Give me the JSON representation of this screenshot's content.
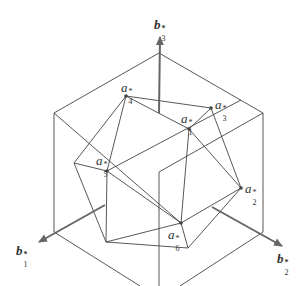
{
  "diagram": {
    "title": "",
    "colors": {
      "line": "#444444",
      "axis": "#666666",
      "background": "#ffffff"
    },
    "axes": [
      {
        "id": "b1",
        "base": "b",
        "sub": "1",
        "sup": "*",
        "from": [
          105,
          205
        ],
        "to": [
          37,
          243
        ]
      },
      {
        "id": "b2",
        "base": "b",
        "sub": "2",
        "sup": "*",
        "from": [
          212,
          207
        ],
        "to": [
          284,
          247
        ]
      },
      {
        "id": "b3",
        "base": "b",
        "sub": "3",
        "sup": "*",
        "from": [
          159,
          113
        ],
        "to": [
          160,
          35
        ]
      }
    ],
    "vertices": [
      {
        "id": "a1",
        "base": "a",
        "sub": "1",
        "sup": "*",
        "pos": [
          189,
          129
        ]
      },
      {
        "id": "a2",
        "base": "a",
        "sub": "2",
        "sup": "*",
        "pos": [
          241,
          188
        ]
      },
      {
        "id": "a3",
        "base": "a",
        "sub": "3",
        "sup": "*",
        "pos": [
          211,
          108
        ]
      },
      {
        "id": "a4",
        "base": "a",
        "sub": "4",
        "sup": "*",
        "pos": [
          126,
          96
        ]
      },
      {
        "id": "a5",
        "base": "a",
        "sub": "5",
        "sup": "*",
        "pos": [
          107,
          171
        ]
      },
      {
        "id": "a6",
        "base": "a",
        "sub": "6",
        "sup": "*",
        "pos": [
          181,
          223
        ]
      }
    ],
    "labels": {
      "b1": {
        "base": "b",
        "sub": "1",
        "sup": "*"
      },
      "b2": {
        "base": "b",
        "sub": "2",
        "sup": "*"
      },
      "b3": {
        "base": "b",
        "sub": "3",
        "sup": "*"
      },
      "a1": {
        "base": "a",
        "sub": "1",
        "sup": "*"
      },
      "a2": {
        "base": "a",
        "sub": "2",
        "sup": "*"
      },
      "a3": {
        "base": "a",
        "sub": "3",
        "sup": "*"
      },
      "a4": {
        "base": "a",
        "sub": "4",
        "sup": "*"
      },
      "a5": {
        "base": "a",
        "sub": "5",
        "sup": "*"
      },
      "a6": {
        "base": "a",
        "sub": "6",
        "sup": "*"
      }
    }
  }
}
